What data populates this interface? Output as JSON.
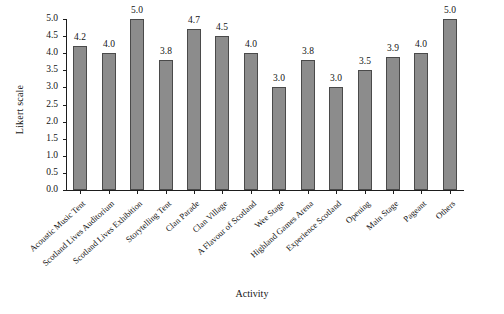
{
  "chart_data": {
    "type": "bar",
    "title": "",
    "xlabel": "Activity",
    "ylabel": "Likert scale",
    "ylim": [
      0.0,
      5.0
    ],
    "ytick_labels": [
      "0.0",
      "0.5",
      "1.0",
      "1.5",
      "2.0",
      "2.5",
      "3.0",
      "3.5",
      "4.0",
      "4.5",
      "5.0"
    ],
    "ytick_values": [
      0.0,
      0.5,
      1.0,
      1.5,
      2.0,
      2.5,
      3.0,
      3.5,
      4.0,
      4.5,
      5.0
    ],
    "grid": false,
    "legend": false,
    "bar_color": "#8c8c8c",
    "bar_edge_color": "#4a4a4a",
    "categories": [
      "Acoustic Music Tent",
      "Scotland Lives Auditorium",
      "Scotland Lives Exhibition",
      "Storytelling Tent",
      "Clan Parade",
      "Clan Village",
      "A Flavour of Scotland",
      "Wee Stage",
      "Highland Games Arena",
      "Experience Scotland",
      "Opening",
      "Main Stage",
      "Pageant",
      "Others"
    ],
    "values": [
      4.2,
      4.0,
      5.0,
      3.8,
      4.7,
      4.5,
      4.0,
      3.0,
      3.8,
      3.0,
      3.5,
      3.9,
      4.0,
      5.0
    ],
    "value_labels": [
      "4.2",
      "4.0",
      "5.0",
      "3.8",
      "4.7",
      "4.5",
      "4.0",
      "3.0",
      "3.8",
      "3.0",
      "3.5",
      "3.9",
      "4.0",
      "5.0"
    ]
  },
  "caption_fragment": ""
}
